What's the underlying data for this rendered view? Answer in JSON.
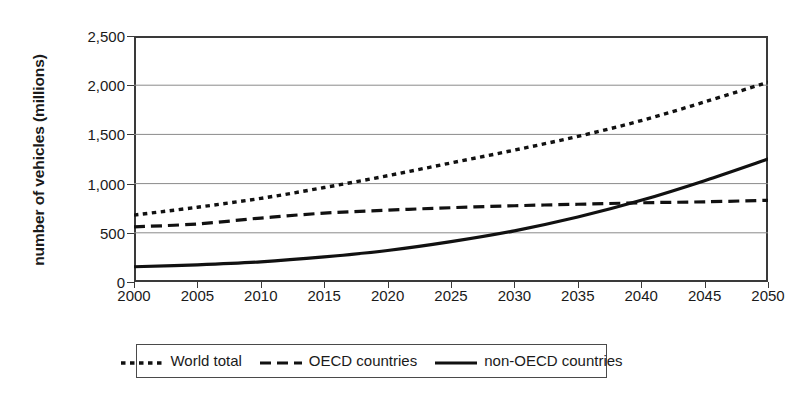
{
  "chart_data": {
    "type": "line",
    "title": "",
    "xlabel": "",
    "ylabel": "number of vehicles (millions)",
    "x": [
      2000,
      2005,
      2010,
      2015,
      2020,
      2025,
      2030,
      2035,
      2040,
      2045,
      2050
    ],
    "xticklabels": [
      "2000",
      "2005",
      "2010",
      "2015",
      "2020",
      "2025",
      "2030",
      "2035",
      "2040",
      "2045",
      "2050"
    ],
    "xlim": [
      2000,
      2050
    ],
    "ylim": [
      0,
      2500
    ],
    "yticks": [
      0,
      500,
      1000,
      1500,
      2000,
      2500
    ],
    "yticklabels": [
      "0",
      "500",
      "1,000",
      "1,500",
      "2,000",
      "2,500"
    ],
    "grid": "horizontal",
    "legend_position": "below-center",
    "series": [
      {
        "name": "World total",
        "style": "dotted",
        "color": "#111111",
        "values": [
          680,
          760,
          850,
          960,
          1080,
          1210,
          1340,
          1480,
          1640,
          1830,
          2030
        ]
      },
      {
        "name": "OECD countries",
        "style": "dashed",
        "color": "#111111",
        "values": [
          560,
          590,
          650,
          700,
          730,
          755,
          775,
          790,
          805,
          815,
          830
        ]
      },
      {
        "name": "non-OECD countries",
        "style": "solid",
        "color": "#111111",
        "values": [
          155,
          175,
          205,
          255,
          320,
          410,
          520,
          660,
          830,
          1030,
          1250
        ]
      }
    ]
  },
  "legend": {
    "items": [
      {
        "label": "World total",
        "style": "dotted"
      },
      {
        "label": "OECD countries",
        "style": "dashed"
      },
      {
        "label": "non-OECD countries",
        "style": "solid"
      }
    ]
  },
  "axes": {
    "y_title": "number of vehicles (millions)",
    "y_labels": [
      "2,500",
      "2,000",
      "1,500",
      "1,000",
      "500",
      "0"
    ],
    "x_labels": [
      "2000",
      "2005",
      "2010",
      "2015",
      "2020",
      "2025",
      "2030",
      "2035",
      "2040",
      "2045",
      "2050"
    ]
  },
  "colors": {
    "axis": "#3a3a3a",
    "grid": "#8a8a8a",
    "series": "#111111",
    "background": "#ffffff"
  }
}
